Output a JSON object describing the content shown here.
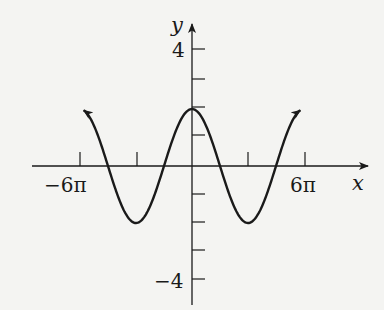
{
  "chart_data": {
    "type": "line",
    "title": "",
    "xlabel": "x",
    "ylabel": "y",
    "function": "y = 2 cos(x/3)",
    "x_tick_labels": [
      "-6π",
      "6π"
    ],
    "x_ticks_pi": [
      -6,
      -3,
      3,
      6
    ],
    "y_tick_labels": [
      "4",
      "-4"
    ],
    "y_ticks": [
      -4,
      -3,
      -2,
      -1,
      1,
      2,
      3,
      4
    ],
    "xlim_pi": [
      -8.5,
      9.5
    ],
    "ylim": [
      -5,
      5
    ],
    "grid": false,
    "legend": null,
    "series": [
      {
        "name": "curve",
        "x_pi": [
          -5.8,
          -4.5,
          -3,
          -1.5,
          0,
          1.5,
          3,
          4.5,
          5.8
        ],
        "y": [
          2.3,
          0,
          -2,
          0,
          2,
          0,
          -2,
          0,
          2.3
        ],
        "arrows_at_ends": true
      }
    ],
    "key_points": {
      "maximum": {
        "x": "0",
        "y": 2
      },
      "minima": [
        {
          "x": "-3π",
          "y": -2
        },
        {
          "x": "3π",
          "y": -2
        }
      ],
      "zeros": [
        "-9π/2",
        "-3π/2",
        "3π/2",
        "9π/2"
      ]
    }
  },
  "labels": {
    "x_axis": "x",
    "y_axis": "y",
    "x_neg": "−6π",
    "x_pos": "6π",
    "y_pos": "4",
    "y_neg": "−4"
  }
}
